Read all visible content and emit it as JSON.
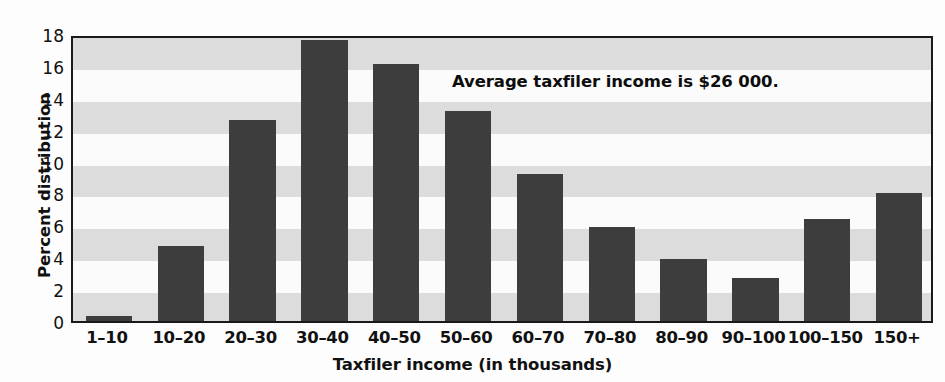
{
  "chart_data": {
    "type": "bar",
    "title": "",
    "xlabel": "Taxfiler income (in thousands)",
    "ylabel": "Percent distribution",
    "categories": [
      "1–10",
      "10–20",
      "20–30",
      "30–40",
      "40–50",
      "50–60",
      "60–70",
      "70–80",
      "80–90",
      "90–100",
      "100–150",
      "150+"
    ],
    "values": [
      0.3,
      4.7,
      12.6,
      17.6,
      16.1,
      13.2,
      9.2,
      5.9,
      3.9,
      2.7,
      6.4,
      8.0
    ],
    "ylim": [
      0,
      18
    ],
    "ytick_labels": [
      "0",
      "2",
      "4",
      "6",
      "8",
      "10",
      "12",
      "14",
      "16",
      "18"
    ],
    "ytick_values": [
      0,
      2,
      4,
      6,
      8,
      10,
      12,
      14,
      16,
      18
    ],
    "grid": "alternating-horizontal-bands",
    "legend": "none",
    "annotations": [
      {
        "text": "Average taxfiler income is $26 000.",
        "x_value": 9.5,
        "y_value": 15.8
      }
    ],
    "bar_color": "#3d3d3d",
    "band_gray_color": "#dcdcdc",
    "band_white_color": "#fbfbfb",
    "axis_color": "#1a1a1a"
  }
}
